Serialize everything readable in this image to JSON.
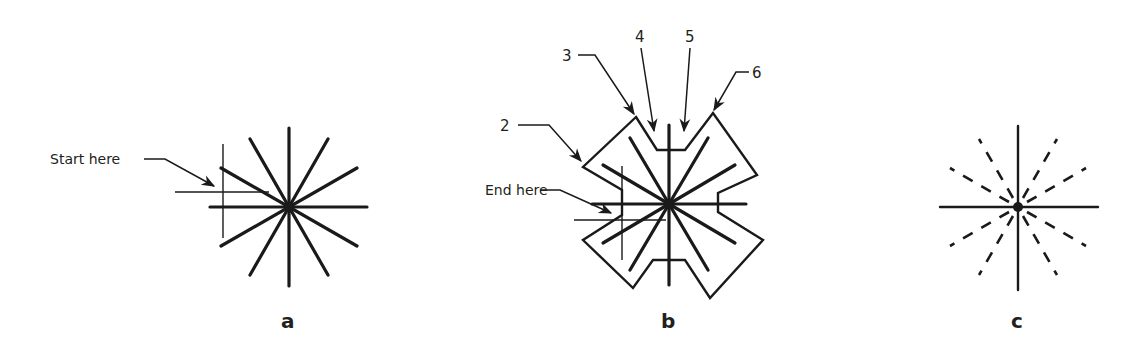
{
  "figure": {
    "panels": [
      {
        "id": "a",
        "label": "a",
        "annotation": "Start here",
        "description": "Twelve-ray star of thick strokes with thin construction cross"
      },
      {
        "id": "b",
        "label": "b",
        "annotation": "End here",
        "callouts": [
          "2",
          "3",
          "4",
          "5",
          "6"
        ],
        "description": "Twelve-ray star enclosed by a notched cross-shaped outline"
      },
      {
        "id": "c",
        "label": "c",
        "description": "Star with solid vertical/horizontal axes and dashed diagonal rays"
      }
    ],
    "colors": {
      "ink": "#1a1a1a",
      "background": "#ffffff"
    }
  }
}
